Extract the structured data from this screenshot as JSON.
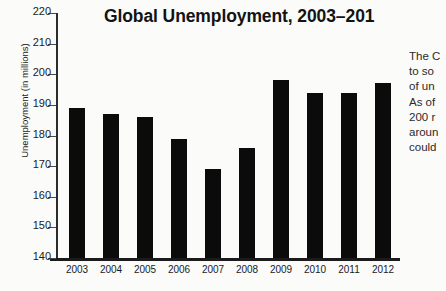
{
  "chart_data": {
    "type": "bar",
    "title": "Global Unemployment, 2003–201",
    "xlabel": "",
    "ylabel": "Unemployment (in millions)",
    "categories": [
      "2003",
      "2004",
      "2005",
      "2006",
      "2007",
      "2008",
      "2009",
      "2010",
      "2011",
      "2012"
    ],
    "values": [
      189,
      187,
      186,
      179,
      169,
      176,
      198,
      194,
      194,
      197
    ],
    "ylim": [
      140,
      220
    ],
    "ytick_labels": [
      "220",
      "210",
      "200",
      "190",
      "180",
      "170",
      "160",
      "150",
      "140"
    ],
    "ytick_values": [
      220,
      210,
      200,
      190,
      180,
      170,
      160,
      150,
      140
    ],
    "ystep": 10,
    "grid": false,
    "legend": "none",
    "bar_color": "#0b0b0b",
    "background_color": "#fbfbfa",
    "axis_color": "#1b1b1b"
  },
  "sidenote": {
    "lines": [
      "The C",
      "to so",
      "of un",
      "As of",
      "200 r",
      "aroun",
      "could"
    ]
  }
}
